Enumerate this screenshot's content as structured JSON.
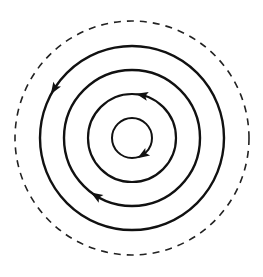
{
  "diagram": {
    "title": "",
    "center": {
      "x": 132,
      "y": 138
    },
    "stroke_color": "#111111",
    "boundary": {
      "style": "dashed",
      "radius": 117,
      "stroke_width": 1.6,
      "dash": "7 6"
    },
    "rings": [
      {
        "id": "ring-1",
        "radius": 92,
        "direction": "counterclockwise",
        "arrow_angle_deg": 212,
        "stroke_width": 2.4
      },
      {
        "id": "ring-2",
        "radius": 68,
        "direction": "clockwise",
        "arrow_angle_deg": 122,
        "stroke_width": 2.4
      },
      {
        "id": "ring-3",
        "radius": 44,
        "direction": "counterclockwise",
        "arrow_angle_deg": 283,
        "stroke_width": 2.2
      },
      {
        "id": "ring-4",
        "radius": 20,
        "direction": "clockwise",
        "arrow_angle_deg": 58,
        "stroke_width": 2.0
      }
    ]
  }
}
